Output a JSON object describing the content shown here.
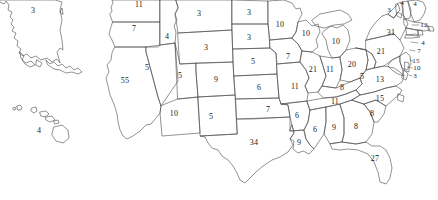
{
  "map": {
    "title": "United States Electoral College Map",
    "type": "choropleth-outline",
    "background_color": "#ffffff",
    "border_color": "#4a4a4a",
    "label_color": "#1a1a1a",
    "total_electoral_votes": 538,
    "states": [
      {
        "code": "AK",
        "name": "Alaska",
        "votes": "3",
        "x": 33,
        "y": 11
      },
      {
        "code": "HI",
        "name": "Hawaii",
        "votes": "4",
        "x": 39,
        "y": 131
      },
      {
        "code": "WA",
        "name": "Washington",
        "votes": "11",
        "x": 139,
        "y": 5
      },
      {
        "code": "OR",
        "name": "Oregon",
        "votes": "7",
        "x": 134,
        "y": 29
      },
      {
        "code": "CA",
        "name": "California",
        "votes": "55",
        "x": 125,
        "y": 81
      },
      {
        "code": "ID",
        "name": "Idaho",
        "votes": "4",
        "x": 167,
        "y": 37
      },
      {
        "code": "NV",
        "name": "Nevada",
        "votes": "5",
        "x": 147,
        "y": 68
      },
      {
        "code": "UT",
        "name": "Utah",
        "votes": "5",
        "x": 180,
        "y": 76
      },
      {
        "code": "AZ",
        "name": "Arizona",
        "votes": "10",
        "x": 174,
        "y": 114
      },
      {
        "code": "MT",
        "name": "Montana",
        "votes": "3",
        "x": 199,
        "y": 14
      },
      {
        "code": "WY",
        "name": "Wyoming",
        "votes": "3",
        "x": 206,
        "y": 48
      },
      {
        "code": "CO",
        "name": "Colorado",
        "votes": "9",
        "x": 216,
        "y": 80
      },
      {
        "code": "NM",
        "name": "New Mexico",
        "votes": "5",
        "x": 211,
        "y": 117
      },
      {
        "code": "ND",
        "name": "North Dakota",
        "votes": "3",
        "x": 249,
        "y": 13
      },
      {
        "code": "SD",
        "name": "South Dakota",
        "votes": "3",
        "x": 249,
        "y": 38
      },
      {
        "code": "NE",
        "name": "Nebraska",
        "votes": "5",
        "x": 253,
        "y": 62
      },
      {
        "code": "KS",
        "name": "Kansas",
        "votes": "6",
        "x": 259,
        "y": 88
      },
      {
        "code": "OK",
        "name": "Oklahoma",
        "votes": "7",
        "x": 268,
        "y": 110
      },
      {
        "code": "TX",
        "name": "Texas",
        "votes": "34",
        "x": 254,
        "y": 143
      },
      {
        "code": "MN",
        "name": "Minnesota",
        "votes": "10",
        "x": 280,
        "y": 25
      },
      {
        "code": "IA",
        "name": "Iowa",
        "votes": "7",
        "x": 288,
        "y": 57
      },
      {
        "code": "MO",
        "name": "Missouri",
        "votes": "11",
        "x": 295,
        "y": 87
      },
      {
        "code": "AR",
        "name": "Arkansas",
        "votes": "6",
        "x": 297,
        "y": 116
      },
      {
        "code": "LA",
        "name": "Louisiana",
        "votes": "9",
        "x": 299,
        "y": 143
      },
      {
        "code": "WI",
        "name": "Wisconsin",
        "votes": "10",
        "x": 306,
        "y": 34
      },
      {
        "code": "IL",
        "name": "Illinois",
        "votes": "21",
        "x": 313,
        "y": 70
      },
      {
        "code": "MI",
        "name": "Michigan",
        "votes": "10",
        "x": 336,
        "y": 42
      },
      {
        "code": "IN",
        "name": "Indiana",
        "votes": "11",
        "x": 330,
        "y": 70
      },
      {
        "code": "OH",
        "name": "Ohio",
        "votes": "20",
        "x": 352,
        "y": 65
      },
      {
        "code": "KY",
        "name": "Kentucky",
        "votes": "8",
        "x": 342,
        "y": 88
      },
      {
        "code": "TN",
        "name": "Tennessee",
        "votes": "11",
        "x": 335,
        "y": 102
      },
      {
        "code": "MS",
        "name": "Mississippi",
        "votes": "6",
        "x": 315,
        "y": 130
      },
      {
        "code": "AL",
        "name": "Alabama",
        "votes": "9",
        "x": 334,
        "y": 128
      },
      {
        "code": "GA",
        "name": "Georgia",
        "votes": "8",
        "x": 356,
        "y": 127
      },
      {
        "code": "FL",
        "name": "Florida",
        "votes": "27",
        "x": 375,
        "y": 159
      },
      {
        "code": "SC",
        "name": "South Carolina",
        "votes": "8",
        "x": 372,
        "y": 114
      },
      {
        "code": "NC",
        "name": "North Carolina",
        "votes": "15",
        "x": 380,
        "y": 99
      },
      {
        "code": "VA",
        "name": "Virginia",
        "votes": "13",
        "x": 380,
        "y": 80
      },
      {
        "code": "WV",
        "name": "West Virginia",
        "votes": "5",
        "x": 362,
        "y": 77
      },
      {
        "code": "PA",
        "name": "Pennsylvania",
        "votes": "21",
        "x": 381,
        "y": 52
      },
      {
        "code": "NY",
        "name": "New York",
        "votes": "31",
        "x": 391,
        "y": 33
      },
      {
        "code": "VT",
        "name": "Vermont",
        "votes": "3",
        "x": 389,
        "y": 10
      },
      {
        "code": "NH",
        "name": "New Hampshire",
        "votes": "4",
        "x": 402,
        "y": 3
      },
      {
        "code": "ME",
        "name": "Maine",
        "votes": "4",
        "x": 415,
        "y": 4
      },
      {
        "code": "MA",
        "name": "Massachusetts",
        "votes": "12",
        "x": 424,
        "y": 25
      },
      {
        "code": "RI",
        "name": "Rhode Island",
        "votes": "4",
        "x": 423,
        "y": 43
      },
      {
        "code": "CT",
        "name": "Connecticut",
        "votes": "7",
        "x": 419,
        "y": 51
      },
      {
        "code": "NJ",
        "name": "New Jersey",
        "votes": "15",
        "x": 416,
        "y": 61
      },
      {
        "code": "MD",
        "name": "Maryland",
        "votes": "10",
        "x": 417,
        "y": 68
      },
      {
        "code": "DE",
        "name": "Delaware",
        "votes": "3",
        "x": 415,
        "y": 76
      }
    ]
  }
}
